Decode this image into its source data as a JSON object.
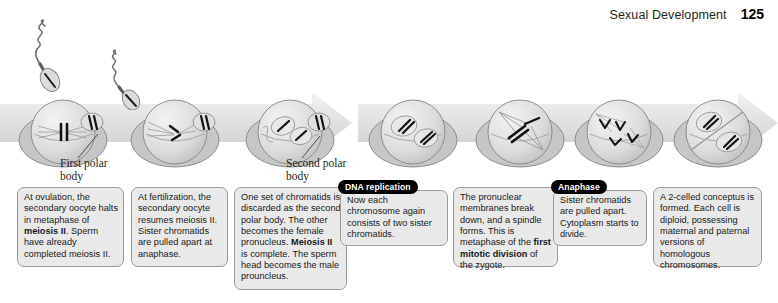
{
  "header": {
    "title": "Sexual Development",
    "page_number": "125"
  },
  "diagram": {
    "labels": [
      {
        "id": "first-polar-body",
        "text": "First polar\nbody"
      },
      {
        "id": "second-polar-body",
        "text": "Second polar\nbody"
      }
    ],
    "stage_tabs": [
      {
        "id": "dna-replication",
        "label": "DNA replication"
      },
      {
        "id": "anaphase",
        "label": "Anaphase"
      }
    ],
    "cells": [
      {
        "id": "cell-1-secondary-oocyte-metaphase-ii"
      },
      {
        "id": "cell-2-fertilization-anaphase-ii"
      },
      {
        "id": "cell-3-second-polar-body-pronuclei"
      },
      {
        "id": "cell-4-two-pronuclei"
      },
      {
        "id": "cell-5-first-mitotic-metaphase"
      },
      {
        "id": "cell-6-mitotic-anaphase"
      },
      {
        "id": "cell-7-two-celled-conceptus"
      }
    ],
    "sperm": [
      {
        "id": "sperm-approaching-1"
      },
      {
        "id": "sperm-approaching-2"
      }
    ]
  },
  "captions": [
    {
      "id": "caption-ovulation",
      "lines": [
        {
          "t": "At ovulation, the"
        },
        {
          "t": "secondary oocyte"
        },
        {
          "t": "halts in metaphase"
        },
        {
          "t": "of "
        },
        {
          "t": "meiosis II",
          "b": true
        },
        {
          "t": ". Sperm"
        },
        {
          "t": "have already"
        },
        {
          "t": "completed meiosis II."
        }
      ],
      "plain": "At ovulation, the secondary oocyte halts in metaphase of meiosis II. Sperm have already completed meiosis II."
    },
    {
      "id": "caption-fertilization",
      "plain": "At fertilization, the secondary oocyte resumes meiosis II. Sister chromatids are pulled apart at anaphase."
    },
    {
      "id": "caption-second-polar-body",
      "plain": "One set of chromatids is discarded as the second polar body. The other becomes the female pronucleus. Meiosis II is complete. The sperm head becomes the male prouncleus."
    },
    {
      "id": "caption-dna-replication",
      "plain": "Now each chromosome again consists of two sister chromatids."
    },
    {
      "id": "caption-first-mitotic-division",
      "plain": "The pronuclear membranes break down, and a spindle forms. This is metaphase of the first mitotic division of the zygote."
    },
    {
      "id": "caption-anaphase",
      "plain": "Sister chromatids are pulled apart. Cytoplasm starts to divide."
    },
    {
      "id": "caption-two-celled-conceptus",
      "plain": "A 2-celled conceptus is formed. Each cell is diploid, possessing maternal and paternal versions of homologous chromosomes."
    }
  ],
  "colors": {
    "caption_fill": "#e9e9e9",
    "caption_border": "#9b9b9b",
    "tab_fill": "#000000",
    "tab_text": "#ffffff",
    "arrow_fill": "#e3e3e3",
    "cell_fill": "#d9d9d9",
    "text": "#1a1a1a",
    "page_bg": "#ffffff"
  }
}
